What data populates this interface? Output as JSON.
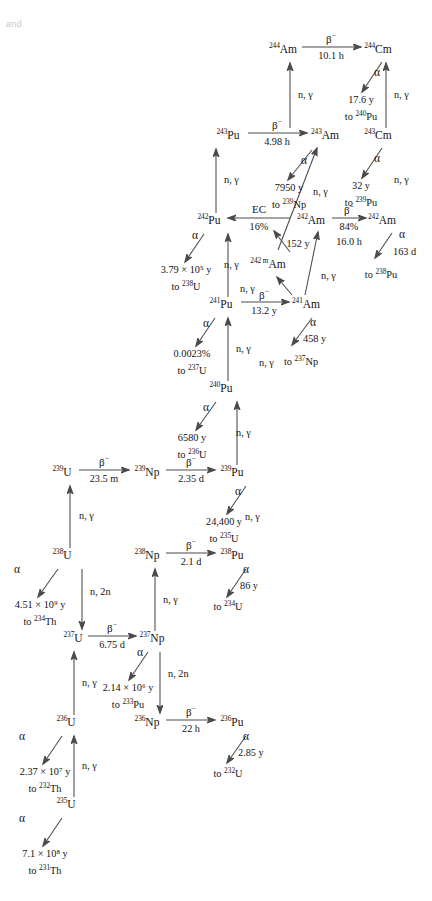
{
  "figure": {
    "type": "nuclear-transmutation-chain",
    "corner_note": "and"
  },
  "nuclides": [
    {
      "id": "am244",
      "mass": "244",
      "element": "Am",
      "x": 283,
      "y": 50
    },
    {
      "id": "cm244",
      "mass": "244",
      "element": "Cm",
      "x": 378,
      "y": 50
    },
    {
      "id": "cm243",
      "mass": "243",
      "element": "Cm",
      "x": 378,
      "y": 136
    },
    {
      "id": "pu243",
      "mass": "243",
      "element": "Pu",
      "x": 228,
      "y": 136
    },
    {
      "id": "am243",
      "mass": "243",
      "element": "Am",
      "x": 325,
      "y": 136
    },
    {
      "id": "pu242",
      "mass": "242",
      "element": "Pu",
      "x": 209,
      "y": 221
    },
    {
      "id": "am242",
      "mass": "242",
      "element": "Am",
      "x": 311,
      "y": 221
    },
    {
      "id": "cm242",
      "mass": "242",
      "element": "Am",
      "x": 382,
      "y": 221
    },
    {
      "id": "am242m",
      "mass": "242 m",
      "element": "Am",
      "x": 268,
      "y": 264
    },
    {
      "id": "pu241",
      "mass": "241",
      "element": "Pu",
      "x": 221,
      "y": 305
    },
    {
      "id": "am241",
      "mass": "241",
      "element": "Am",
      "x": 306,
      "y": 305
    },
    {
      "id": "pu240",
      "mass": "240",
      "element": "Pu",
      "x": 221,
      "y": 389
    },
    {
      "id": "u239",
      "mass": "239",
      "element": "U",
      "x": 62,
      "y": 473
    },
    {
      "id": "np239",
      "mass": "239",
      "element": "Np",
      "x": 147,
      "y": 473
    },
    {
      "id": "pu239",
      "mass": "239",
      "element": "Pu",
      "x": 232,
      "y": 473
    },
    {
      "id": "u238",
      "mass": "238",
      "element": "U",
      "x": 62,
      "y": 556
    },
    {
      "id": "np238",
      "mass": "238",
      "element": "Np",
      "x": 147,
      "y": 556
    },
    {
      "id": "pu238",
      "mass": "238",
      "element": "Pu",
      "x": 232,
      "y": 556
    },
    {
      "id": "u237",
      "mass": "237",
      "element": "U",
      "x": 73,
      "y": 639
    },
    {
      "id": "np237",
      "mass": "237",
      "element": "Np",
      "x": 152,
      "y": 639
    },
    {
      "id": "u236",
      "mass": "236",
      "element": "U",
      "x": 66,
      "y": 723
    },
    {
      "id": "np236",
      "mass": "236",
      "element": "Np",
      "x": 147,
      "y": 723
    },
    {
      "id": "pu236",
      "mass": "236",
      "element": "Pu",
      "x": 232,
      "y": 723
    },
    {
      "id": "u235",
      "mass": "235",
      "element": "U",
      "x": 66,
      "y": 805
    }
  ],
  "transitions": [
    {
      "id": "t-am244-cm244",
      "mode": "β",
      "superscript": "−",
      "halflife": "10.1 h"
    },
    {
      "id": "t-pu243-am243",
      "mode": "β",
      "superscript": "−",
      "halflife": "4.98 h"
    },
    {
      "id": "t-am242-cm242",
      "mode": "β",
      "superscript": "−",
      "branch": "84%",
      "halflife": "16.0 h"
    },
    {
      "id": "t-am242-pu242",
      "mode": "EC",
      "branch": "16%"
    },
    {
      "id": "t-pu241-am241",
      "mode": "β",
      "superscript": "−",
      "halflife": "13.2 y"
    },
    {
      "id": "t-u239-np239",
      "mode": "β",
      "superscript": "−",
      "halflife": "23.5 m"
    },
    {
      "id": "t-np239-pu239",
      "mode": "β",
      "superscript": "−",
      "halflife": "2.35 d"
    },
    {
      "id": "t-np238-pu238",
      "mode": "β",
      "superscript": "−",
      "halflife": "2.1 d"
    },
    {
      "id": "t-u237-np237",
      "mode": "β",
      "superscript": "−",
      "halflife": "6.75 d"
    },
    {
      "id": "t-np236-pu236",
      "mode": "β",
      "superscript": "−",
      "halflife": "22 h"
    }
  ],
  "alpha_decays": [
    {
      "id": "a-cm244",
      "symbol": "α",
      "halflife": "17.6 y",
      "product_mass": "240",
      "product_element": "Pu"
    },
    {
      "id": "a-cm243",
      "symbol": "α",
      "halflife": "32 y",
      "product_mass": "239",
      "product_element": "Pu"
    },
    {
      "id": "a-am243",
      "symbol": "α",
      "halflife": "7950 y",
      "product_mass": "239",
      "product_element": "Np"
    },
    {
      "id": "a-cm242",
      "symbol": "α",
      "halflife": "163 d",
      "product_mass": "238",
      "product_element": "Pu"
    },
    {
      "id": "a-am242m",
      "symbol": "α",
      "halflife": "152 y"
    },
    {
      "id": "a-pu242",
      "symbol": "α",
      "halflife": "3.79 × 10⁵ y",
      "product_mass": "238",
      "product_element": "U"
    },
    {
      "id": "a-am241",
      "symbol": "α",
      "halflife": "458 y",
      "product_mass": "237",
      "product_element": "Np"
    },
    {
      "id": "a-pu241",
      "symbol": "α",
      "halflife": "0.0023%",
      "product_mass": "237",
      "product_element": "U"
    },
    {
      "id": "a-pu240",
      "symbol": "α",
      "halflife": "6580 y",
      "product_mass": "236",
      "product_element": "U"
    },
    {
      "id": "a-pu239",
      "symbol": "α",
      "halflife": "24,400 y",
      "product_mass": "235",
      "product_element": "U"
    },
    {
      "id": "a-pu238",
      "symbol": "α",
      "halflife": "86 y",
      "product_mass": "234",
      "product_element": "U"
    },
    {
      "id": "a-u238",
      "symbol": "α",
      "halflife": "4.51 × 10⁹ y",
      "product_mass": "234",
      "product_element": "Th"
    },
    {
      "id": "a-np237",
      "symbol": "α",
      "halflife": "2.14 × 10⁶ y",
      "product_mass": "233",
      "product_element": "Pu"
    },
    {
      "id": "a-pu236",
      "symbol": "α",
      "halflife": "2.85 y",
      "product_mass": "232",
      "product_element": "U"
    },
    {
      "id": "a-u236",
      "symbol": "α",
      "halflife": "2.37 × 10⁷ y",
      "product_mass": "232",
      "product_element": "Th"
    },
    {
      "id": "a-u235",
      "symbol": "α",
      "halflife": "7.1 × 10⁸ y",
      "product_mass": "231",
      "product_element": "Th"
    }
  ],
  "capture_labels": [
    {
      "id": "ng-am244",
      "text": "n, γ"
    },
    {
      "id": "ng-cm244",
      "text": "n, γ"
    },
    {
      "id": "ng-pu243",
      "text": "n, γ"
    },
    {
      "id": "ng-am243",
      "text": "n, γ"
    },
    {
      "id": "ng-cm243",
      "text": "n, γ"
    },
    {
      "id": "ng-pu242",
      "text": "n, γ"
    },
    {
      "id": "ng-am242",
      "text": "n, γ"
    },
    {
      "id": "ng-am242m",
      "text": "n, γ"
    },
    {
      "id": "ng-pu241",
      "text": "n, γ"
    },
    {
      "id": "ng-am241",
      "text": "n, γ"
    },
    {
      "id": "ng-pu240",
      "text": "n, γ"
    },
    {
      "id": "ng-u239",
      "text": "n, γ"
    },
    {
      "id": "ng-pu239",
      "text": "n, γ"
    },
    {
      "id": "ng-np238",
      "text": "n, γ"
    },
    {
      "id": "ng-u237",
      "text": "n, γ"
    },
    {
      "id": "ng-u236",
      "text": "n, γ"
    },
    {
      "id": "n2n-u238",
      "text": "n, 2n"
    },
    {
      "id": "n2n-np237",
      "text": "n, 2n"
    }
  ]
}
